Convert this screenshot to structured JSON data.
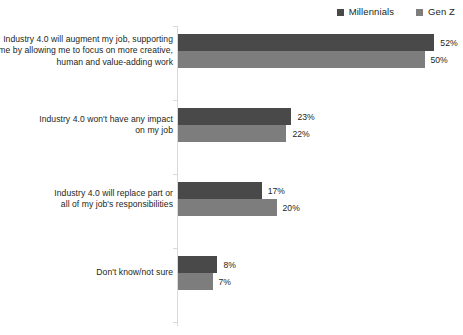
{
  "legend": {
    "position": "top-right",
    "items": [
      {
        "label": "Millennials",
        "color": "#494949",
        "icon": "square-swatch-icon"
      },
      {
        "label": "Gen Z",
        "color": "#7d7d7d",
        "icon": "square-swatch-icon"
      }
    ]
  },
  "chart_data": {
    "type": "bar",
    "orientation": "horizontal",
    "title": "",
    "subtitle": "",
    "xlabel": "",
    "ylabel": "",
    "xlim": [
      0,
      52
    ],
    "grid": false,
    "legend_position": "top-right",
    "value_suffix": "%",
    "categories": [
      "Industry 4.0 will augment my job, supporting me by allowing me to focus on more creative, human and value-adding work",
      "Industry 4.0 won't have any impact on my job",
      "Industry 4.0 will replace part or all of my job's responsibilities",
      "Don't know/not sure"
    ],
    "category_lines": [
      [
        "Industry 4.0 will augment my job, supporting",
        "me by allowing me to focus on more creative,",
        "human and value-adding work"
      ],
      [
        "Industry 4.0 won't have any impact",
        "on my job"
      ],
      [
        "Industry 4.0 will replace part or",
        "all of my job's responsibilities"
      ],
      [
        "Don't know/not sure"
      ]
    ],
    "series": [
      {
        "name": "Millennials",
        "color": "#494949",
        "values": [
          52,
          23,
          17,
          8
        ],
        "labels": [
          "52%",
          "23%",
          "17%",
          "8%"
        ]
      },
      {
        "name": "Gen Z",
        "color": "#7d7d7d",
        "values": [
          50,
          22,
          20,
          7
        ],
        "labels": [
          "50%",
          "22%",
          "20%",
          "7%"
        ]
      }
    ]
  },
  "axis": {
    "line_color": "#d9d9d9",
    "tick_count": 5
  }
}
